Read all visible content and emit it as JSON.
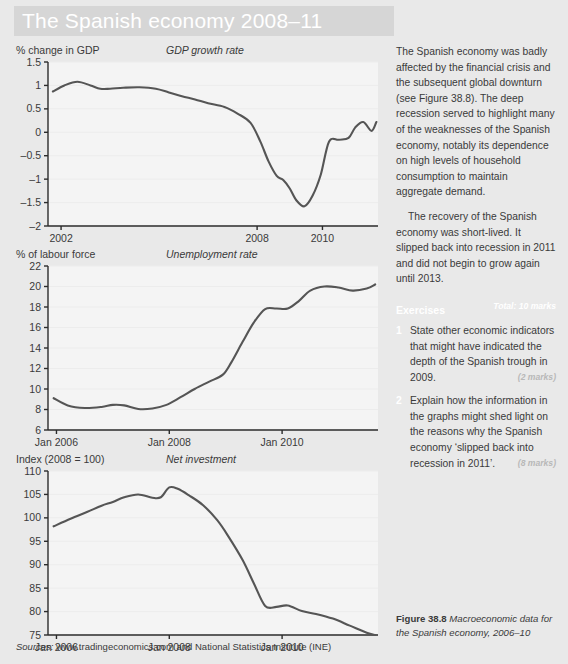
{
  "header": {
    "title": "The Spanish economy 2008–11"
  },
  "sources": {
    "lead": "Sources:",
    "text": " www.tradingeconomics.com and National Statistics Institute (INE)"
  },
  "figure_caption": {
    "label": "Figure 38.8",
    "text": " Macroeconomic data for the Spanish economy, 2006–10"
  },
  "article": {
    "paragraphs": [
      "The Spanish economy was badly affected by the financial crisis and the subsequent global downturn (see Figure 38.8). The deep recession served to highlight many of the weaknesses of the Spanish economy, notably its dependence on high levels of household consumption to maintain aggregate demand.",
      "The recovery of the Spanish economy was short-lived. It slipped back into recession in 2011 and did not begin to grow again until 2013."
    ]
  },
  "exercises": {
    "title": "Exercises",
    "total": "Total: 10 marks",
    "items": [
      {
        "number": "1",
        "text": "State other economic indicators that might have indicated the depth of the Spanish trough in 2009.",
        "marks": "(2 marks)"
      },
      {
        "number": "2",
        "text": "Explain how the information in the graphs might shed light on the reasons why the Spanish economy ‘slipped back into recession in 2011’.",
        "marks": "(8 marks)"
      }
    ]
  },
  "colors": {
    "page_background": "#e9e9e9",
    "header_band": "#d6d6d6",
    "plot_background": "#f4f4f4",
    "line": "#555555",
    "axis": "#2b2b2b",
    "text": "#3a3a3a",
    "accent_white": "#ffffff"
  },
  "chart_data": [
    {
      "id": "gdp-growth-rate",
      "type": "line",
      "title": "GDP growth rate",
      "ylabel": "% change in GDP",
      "xlabel": "",
      "ylim": [
        -2,
        1.5
      ],
      "yticks": [
        -2,
        -1.5,
        -1,
        -0.5,
        0,
        0.5,
        1,
        1.5
      ],
      "ytick_labels": [
        "–2",
        "–1.5",
        "–1",
        "–0.5",
        "0",
        "0.5",
        "1",
        "1.5"
      ],
      "xlim": [
        2001.6,
        2011.7
      ],
      "xticks": [
        2002,
        2008,
        2010
      ],
      "xtick_labels": [
        "2002",
        "2008",
        "2010"
      ],
      "grid": false,
      "x": [
        2001.75,
        2002.1,
        2002.5,
        2002.9,
        2003.2,
        2003.5,
        2003.9,
        2004.4,
        2004.9,
        2005.3,
        2005.7,
        2006.1,
        2006.5,
        2007.0,
        2007.4,
        2007.8,
        2008.1,
        2008.35,
        2008.6,
        2008.8,
        2009.0,
        2009.2,
        2009.45,
        2009.7,
        2009.95,
        2010.2,
        2010.5,
        2010.8,
        2011.0,
        2011.25,
        2011.5,
        2011.65
      ],
      "y": [
        0.87,
        1.0,
        1.08,
        1.0,
        0.93,
        0.93,
        0.95,
        0.96,
        0.93,
        0.85,
        0.77,
        0.7,
        0.62,
        0.54,
        0.4,
        0.2,
        -0.2,
        -0.62,
        -0.93,
        -1.02,
        -1.2,
        -1.45,
        -1.58,
        -1.35,
        -0.9,
        -0.2,
        -0.16,
        -0.12,
        0.1,
        0.22,
        0.03,
        0.22
      ]
    },
    {
      "id": "unemployment-rate",
      "type": "line",
      "title": "Unemployment rate",
      "ylabel": "% of labour force",
      "xlabel": "",
      "ylim": [
        6,
        22
      ],
      "yticks": [
        6,
        8,
        10,
        12,
        14,
        16,
        18,
        20,
        22
      ],
      "ytick_labels": [
        "6",
        "8",
        "10",
        "12",
        "14",
        "16",
        "18",
        "20",
        "22"
      ],
      "xlim": [
        2005.85,
        2011.7
      ],
      "xticks": [
        2006.0,
        2008.0,
        2010.0
      ],
      "xtick_labels": [
        "Jan 2006",
        "Jan 2008",
        "Jan 2010"
      ],
      "grid": false,
      "x": [
        2005.95,
        2006.2,
        2006.5,
        2006.8,
        2007.0,
        2007.2,
        2007.45,
        2007.7,
        2007.95,
        2008.2,
        2008.45,
        2008.7,
        2008.95,
        2009.1,
        2009.3,
        2009.5,
        2009.7,
        2009.9,
        2010.1,
        2010.3,
        2010.5,
        2010.75,
        2011.0,
        2011.25,
        2011.5,
        2011.65
      ],
      "y": [
        9.1,
        8.4,
        8.15,
        8.25,
        8.45,
        8.4,
        8.05,
        8.1,
        8.45,
        9.2,
        10.0,
        10.7,
        11.4,
        12.6,
        14.6,
        16.5,
        17.8,
        17.85,
        17.85,
        18.6,
        19.6,
        20.0,
        19.9,
        19.6,
        19.8,
        20.2
      ]
    },
    {
      "id": "net-investment",
      "type": "line",
      "title": "Net investment",
      "ylabel": "Index (2008 = 100)",
      "xlabel": "",
      "ylim": [
        75,
        110
      ],
      "yticks": [
        75,
        80,
        85,
        90,
        95,
        100,
        105,
        110
      ],
      "ytick_labels": [
        "75",
        "80",
        "85",
        "90",
        "95",
        "100",
        "105",
        "110"
      ],
      "xlim": [
        2005.85,
        2011.7
      ],
      "xticks": [
        2006.0,
        2008.0,
        2010.0
      ],
      "xtick_labels": [
        "Jan 2006",
        "Jan 2008",
        "Jan 2010"
      ],
      "grid": false,
      "x": [
        2005.95,
        2006.25,
        2006.55,
        2006.8,
        2007.0,
        2007.2,
        2007.45,
        2007.7,
        2007.85,
        2008.0,
        2008.15,
        2008.35,
        2008.6,
        2008.85,
        2009.05,
        2009.3,
        2009.5,
        2009.7,
        2009.9,
        2010.1,
        2010.35,
        2010.6,
        2010.9,
        2011.2,
        2011.5,
        2011.65
      ],
      "y": [
        98.2,
        99.8,
        101.3,
        102.6,
        103.4,
        104.4,
        105.0,
        104.3,
        104.4,
        106.5,
        106.2,
        104.8,
        102.7,
        99.5,
        96.0,
        91.0,
        86.0,
        81.2,
        81.0,
        81.3,
        80.1,
        79.5,
        78.5,
        77.0,
        75.5,
        75.0
      ]
    }
  ]
}
